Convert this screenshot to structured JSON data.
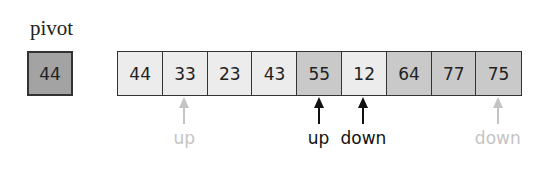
{
  "pivot": {
    "label": "pivot",
    "value": "44",
    "color": "#a3a3a3"
  },
  "array": {
    "cells": [
      {
        "value": "44",
        "color": "#ececec"
      },
      {
        "value": "33",
        "color": "#ececec"
      },
      {
        "value": "23",
        "color": "#ececec"
      },
      {
        "value": "43",
        "color": "#ececec"
      },
      {
        "value": "55",
        "color": "#c9c9c9"
      },
      {
        "value": "12",
        "color": "#ececec"
      },
      {
        "value": "64",
        "color": "#c9c9c9"
      },
      {
        "value": "77",
        "color": "#c9c9c9"
      },
      {
        "value": "75",
        "color": "#c9c9c9"
      }
    ]
  },
  "pointers": [
    {
      "label": "up",
      "index": 1,
      "color": "#c4c4c4",
      "state": "previous"
    },
    {
      "label": "up",
      "index": 4,
      "color": "#111111",
      "state": "current"
    },
    {
      "label": "down",
      "index": 5,
      "color": "#111111",
      "state": "current"
    },
    {
      "label": "down",
      "index": 8,
      "color": "#c4c4c4",
      "state": "previous"
    }
  ]
}
